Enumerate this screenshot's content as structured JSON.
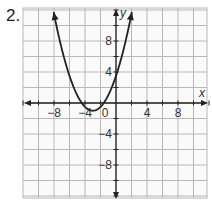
{
  "problem": {
    "number": "2."
  },
  "chart_data": {
    "type": "line",
    "title": "",
    "xlabel": "x",
    "ylabel": "y",
    "xlim": [
      -12,
      12
    ],
    "ylim": [
      -12,
      12
    ],
    "grid": true,
    "grid_step": 2,
    "x_tick_labels": [
      "-8",
      "-4",
      "0",
      "4",
      "8"
    ],
    "x_tick_values": [
      -8,
      -4,
      0,
      4,
      8
    ],
    "y_tick_labels": [
      "8",
      "4",
      "-4",
      "-8"
    ],
    "y_tick_values": [
      8,
      4,
      -4,
      -8
    ],
    "series": [
      {
        "name": "parabola",
        "equation": "y = 0.5(x + 3)^2 - 1",
        "vertex": [
          -3,
          -1
        ],
        "y_intercept": 3.5,
        "x_intercepts": [
          -4.4,
          -1.6
        ],
        "x": [
          -9.1,
          -8,
          -7,
          -6,
          -5,
          -4,
          -3,
          -2,
          -1,
          0,
          1,
          1.4
        ],
        "y": [
          12,
          11.5,
          7,
          3.5,
          1,
          -0.5,
          -1,
          -0.5,
          1,
          3.5,
          7,
          12
        ],
        "arrows_at_ends": true
      }
    ],
    "colors": {
      "grid": "#b8b8b8",
      "axes": "#222222",
      "curve": "#222222"
    }
  },
  "labels": {
    "x_axis": "x",
    "y_axis": "y",
    "x_ticks": [
      "−8",
      "−4",
      "0",
      "4",
      "8"
    ],
    "y_ticks": [
      "8",
      "4",
      "−4",
      "−8"
    ]
  }
}
